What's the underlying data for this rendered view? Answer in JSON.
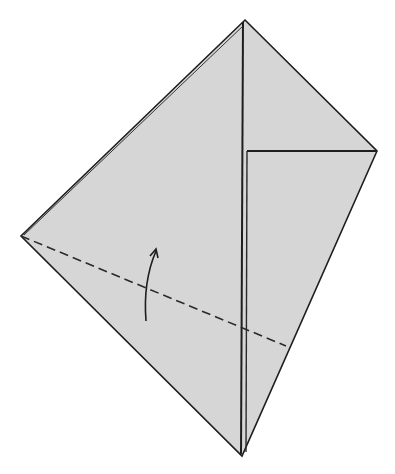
{
  "diagram": {
    "type": "origami-step",
    "width": 395,
    "height": 474,
    "colors": {
      "background": "#ffffff",
      "paper_fill": "#d6d6d6",
      "edge": "#1e1e1e",
      "dash": "#2a2a2a",
      "arrow": "#1e1e1e"
    },
    "vertices": {
      "top": [
        245,
        20
      ],
      "right": [
        377,
        151
      ],
      "bottom": [
        242,
        456
      ],
      "left": [
        21,
        236
      ],
      "flap_corner": [
        247,
        151
      ]
    },
    "outline": "M245,20 L377,151 L242,456 L21,236 Z",
    "outer_edge_inner_line": "M244,25 L24,235",
    "center_crease": "M243,22 L241,454",
    "center_crease_inner": "M247,151 L246,452",
    "flap_edge": "M247,151 L377,151",
    "valley_fold_line": "M21,236 L286,346",
    "arrow_path": "M146,321 C144,296 147,272 156,251",
    "arrowhead": "M150,256 L156,249 L158,258",
    "labels": []
  }
}
